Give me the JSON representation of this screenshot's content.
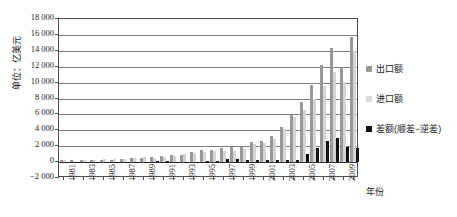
{
  "chart_data": {
    "type": "bar",
    "title": "",
    "xlabel": "年份",
    "ylabel": "单位：亿美元",
    "ylim": [
      -2000,
      18000
    ],
    "ytick_step": 2000,
    "grid": true,
    "legend_position": "right",
    "yticks": [
      "18 000",
      "16 000",
      "14 000",
      "12 000",
      "10 000",
      "8 000",
      "6 000",
      "4 000",
      "2 000",
      "0",
      "−2 000"
    ],
    "ytick_values": [
      18000,
      16000,
      14000,
      12000,
      10000,
      8000,
      6000,
      4000,
      2000,
      0,
      -2000
    ],
    "categories": [
      1981,
      1982,
      1983,
      1984,
      1985,
      1986,
      1987,
      1988,
      1989,
      1990,
      1991,
      1992,
      1993,
      1994,
      1995,
      1996,
      1997,
      1998,
      1999,
      2000,
      2001,
      2002,
      2003,
      2004,
      2005,
      2006,
      2007,
      2008,
      2009,
      2010
    ],
    "xtick_labels": [
      "1981",
      "1983",
      "1985",
      "1987",
      "1989",
      "1991",
      "1993",
      "1995",
      "1997",
      "1999",
      "2001",
      "2003",
      "2005",
      "2007",
      "2009"
    ],
    "series": [
      {
        "name": "出口额",
        "color": "#999999",
        "values": [
          220,
          223,
          222,
          261,
          274,
          309,
          394,
          475,
          525,
          621,
          719,
          849,
          917,
          1210,
          1488,
          1511,
          1828,
          1837,
          1949,
          2492,
          2661,
          3256,
          4382,
          5933,
          7620,
          9690,
          12180,
          14307,
          12016,
          15779
        ]
      },
      {
        "name": "进口额",
        "color": "#d4d4d4",
        "values": [
          220,
          192,
          214,
          274,
          422,
          429,
          432,
          552,
          591,
          534,
          638,
          806,
          1040,
          1156,
          1321,
          1388,
          1424,
          1402,
          1657,
          2251,
          2436,
          2952,
          4128,
          5612,
          6600,
          7915,
          9560,
          11326,
          10059,
          13962
        ]
      },
      {
        "name": "差额(顺差−逆差)",
        "color": "#111111",
        "values": [
          0,
          31,
          8,
          -13,
          -148,
          -120,
          -38,
          -77,
          -66,
          87,
          81,
          43,
          -123,
          54,
          167,
          123,
          404,
          435,
          292,
          241,
          225,
          304,
          254,
          321,
          1020,
          1775,
          2620,
          2981,
          1957,
          1817
        ]
      }
    ]
  },
  "axis": {
    "ytitle": "单位：亿美元",
    "xtitle": "年份"
  },
  "legend": {
    "items": [
      {
        "label": "出口额",
        "swatch": "export-swatch"
      },
      {
        "label": "进口额",
        "swatch": "import-swatch"
      },
      {
        "label": "差额(顺差−逆差)",
        "swatch": "balance-swatch"
      }
    ]
  }
}
